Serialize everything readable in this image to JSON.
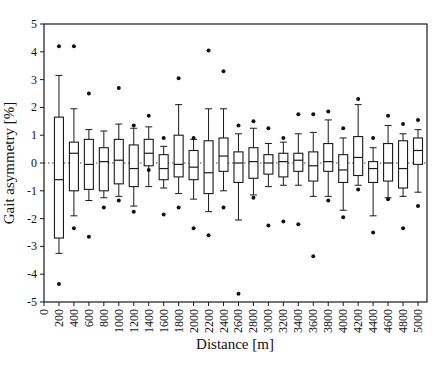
{
  "figure": {
    "xlabel": "Distance [m]",
    "ylabel": "Gait asymmetry [%]"
  },
  "chart_data": {
    "type": "boxplot",
    "title": "",
    "xlabel": "Distance [m]",
    "ylabel": "Gait asymmetry [%]",
    "grid": false,
    "zero_line_style": "dotted",
    "frame": "full-box",
    "xlim": [
      0,
      5120
    ],
    "ylim": [
      -5,
      5
    ],
    "x_ticks": [
      0,
      200,
      400,
      600,
      800,
      1000,
      1200,
      1400,
      1600,
      1800,
      2000,
      2200,
      2400,
      2600,
      2800,
      3000,
      3200,
      3400,
      3600,
      3800,
      4000,
      4200,
      4400,
      4600,
      4800,
      5000
    ],
    "y_ticks": [
      5,
      4,
      3,
      2,
      1,
      0,
      -1,
      -2,
      -3,
      -4,
      -5
    ],
    "line_color": "#1a1a1a",
    "box_fill": "#ffffff",
    "outlier_color": "#111111",
    "boxes": [
      {
        "x": 200,
        "whisker_low": -3.25,
        "q1": -2.7,
        "median": -0.6,
        "q3": 1.65,
        "whisker_high": 3.15,
        "outliers": [
          4.2,
          -4.35
        ]
      },
      {
        "x": 400,
        "whisker_low": -1.9,
        "q1": -1.0,
        "median": 0.35,
        "q3": 0.75,
        "whisker_high": 1.95,
        "outliers": [
          4.2,
          -2.35
        ]
      },
      {
        "x": 600,
        "whisker_low": -1.35,
        "q1": -0.95,
        "median": -0.05,
        "q3": 0.85,
        "whisker_high": 1.2,
        "outliers": [
          2.5,
          -2.65
        ]
      },
      {
        "x": 800,
        "whisker_low": -1.25,
        "q1": -1.0,
        "median": 0.05,
        "q3": 0.55,
        "whisker_high": 1.15,
        "outliers": [
          -1.6
        ]
      },
      {
        "x": 1000,
        "whisker_low": -1.2,
        "q1": -0.75,
        "median": 0.1,
        "q3": 0.85,
        "whisker_high": 1.4,
        "outliers": [
          2.7,
          -1.35
        ]
      },
      {
        "x": 1200,
        "whisker_low": -1.55,
        "q1": -0.85,
        "median": -0.2,
        "q3": 0.65,
        "whisker_high": 1.25,
        "outliers": [
          1.35,
          -1.75
        ]
      },
      {
        "x": 1400,
        "whisker_low": -0.85,
        "q1": -0.1,
        "median": 0.35,
        "q3": 0.85,
        "whisker_high": 1.3,
        "outliers": [
          1.7,
          -0.25
        ]
      },
      {
        "x": 1600,
        "whisker_low": -0.9,
        "q1": -0.6,
        "median": -0.2,
        "q3": 0.3,
        "whisker_high": 0.6,
        "outliers": [
          0.9,
          -1.85
        ]
      },
      {
        "x": 1800,
        "whisker_low": -1.1,
        "q1": -0.5,
        "median": -0.05,
        "q3": 1.0,
        "whisker_high": 2.1,
        "outliers": [
          3.05,
          -1.6
        ]
      },
      {
        "x": 2000,
        "whisker_low": -1.3,
        "q1": -0.6,
        "median": -0.15,
        "q3": 0.45,
        "whisker_high": 0.85,
        "outliers": [
          0.9,
          -2.35
        ]
      },
      {
        "x": 2200,
        "whisker_low": -1.75,
        "q1": -1.1,
        "median": -0.35,
        "q3": 0.8,
        "whisker_high": 1.95,
        "outliers": [
          4.05,
          -2.6
        ]
      },
      {
        "x": 2400,
        "whisker_low": -1.0,
        "q1": -0.3,
        "median": 0.25,
        "q3": 0.9,
        "whisker_high": 1.95,
        "outliers": [
          3.3,
          -1.6
        ]
      },
      {
        "x": 2600,
        "whisker_low": -2.05,
        "q1": -0.7,
        "median": 0.0,
        "q3": 0.4,
        "whisker_high": 1.05,
        "outliers": [
          1.35,
          -4.7
        ]
      },
      {
        "x": 2800,
        "whisker_low": -1.15,
        "q1": -0.55,
        "median": 0.05,
        "q3": 0.55,
        "whisker_high": 1.25,
        "outliers": [
          1.5,
          -1.25
        ]
      },
      {
        "x": 3000,
        "whisker_low": -0.85,
        "q1": -0.4,
        "median": 0.0,
        "q3": 0.3,
        "whisker_high": 0.7,
        "outliers": [
          1.25,
          -2.25
        ]
      },
      {
        "x": 3200,
        "whisker_low": -0.8,
        "q1": -0.5,
        "median": 0.05,
        "q3": 0.35,
        "whisker_high": 0.75,
        "outliers": [
          0.9,
          -2.1
        ]
      },
      {
        "x": 3400,
        "whisker_low": -0.8,
        "q1": -0.3,
        "median": 0.1,
        "q3": 0.35,
        "whisker_high": 1.05,
        "outliers": [
          1.75,
          -2.2
        ]
      },
      {
        "x": 3600,
        "whisker_low": -1.2,
        "q1": -0.65,
        "median": -0.1,
        "q3": 0.4,
        "whisker_high": 1.1,
        "outliers": [
          1.75,
          -3.35
        ]
      },
      {
        "x": 3800,
        "whisker_low": -1.2,
        "q1": -0.3,
        "median": 0.05,
        "q3": 0.7,
        "whisker_high": 1.55,
        "outliers": [
          1.85,
          -1.35
        ]
      },
      {
        "x": 4000,
        "whisker_low": -1.7,
        "q1": -0.7,
        "median": -0.25,
        "q3": 0.3,
        "whisker_high": 0.9,
        "outliers": [
          1.25,
          -1.95
        ]
      },
      {
        "x": 4200,
        "whisker_low": -0.8,
        "q1": -0.45,
        "median": 0.2,
        "q3": 0.95,
        "whisker_high": 2.1,
        "outliers": [
          2.3,
          -0.95
        ]
      },
      {
        "x": 4400,
        "whisker_low": -1.9,
        "q1": -0.7,
        "median": -0.2,
        "q3": 0.05,
        "whisker_high": 0.55,
        "outliers": [
          0.9,
          -2.5
        ]
      },
      {
        "x": 4600,
        "whisker_low": -1.25,
        "q1": -0.65,
        "median": 0.0,
        "q3": 0.7,
        "whisker_high": 1.35,
        "outliers": [
          1.7,
          -1.3
        ]
      },
      {
        "x": 4800,
        "whisker_low": -1.2,
        "q1": -0.9,
        "median": -0.2,
        "q3": 0.8,
        "whisker_high": 1.05,
        "outliers": [
          1.4,
          -2.35
        ]
      },
      {
        "x": 5000,
        "whisker_low": -1.05,
        "q1": -0.05,
        "median": 0.45,
        "q3": 0.9,
        "whisker_high": 1.2,
        "outliers": [
          1.55,
          -1.55
        ]
      }
    ]
  }
}
